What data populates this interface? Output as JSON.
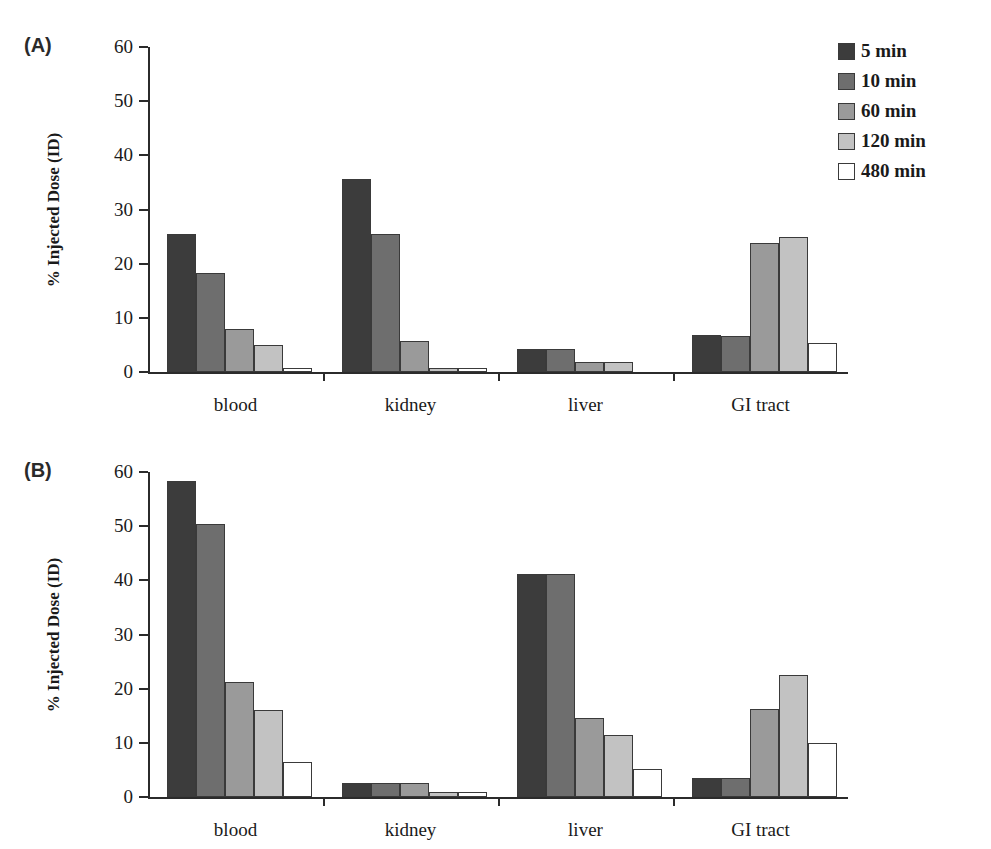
{
  "figure": {
    "panels": [
      {
        "id": "A",
        "label": "(A)"
      },
      {
        "id": "B",
        "label": "(B)"
      }
    ],
    "ylabel": "% Injected Dose (ID)",
    "series_colors": [
      "#3c3c3c",
      "#6e6e6e",
      "#9a9a9a",
      "#c2c2c2",
      "#ffffff"
    ],
    "ytick_labels": [
      "0",
      "10",
      "20",
      "30",
      "40",
      "50",
      "60"
    ]
  },
  "legend": {
    "items": [
      {
        "label": "5 min",
        "color": "#3c3c3c"
      },
      {
        "label": "10 min",
        "color": "#6e6e6e"
      },
      {
        "label": "60 min",
        "color": "#9a9a9a"
      },
      {
        "label": "120 min",
        "color": "#c2c2c2"
      },
      {
        "label": "480 min",
        "color": "#ffffff"
      }
    ]
  },
  "chart_data": [
    {
      "type": "bar",
      "panel": "A",
      "title": "(A)",
      "xlabel": "",
      "ylabel": "% Injected Dose (ID)",
      "ylim": [
        0,
        60
      ],
      "yticks": [
        0,
        10,
        20,
        30,
        40,
        50,
        60
      ],
      "grid": false,
      "legend_position": "top-right",
      "categories": [
        "blood",
        "kidney",
        "liver",
        "GI tract"
      ],
      "series": [
        {
          "name": "5 min",
          "color": "#3c3c3c",
          "values": [
            25.4,
            35.7,
            4.2,
            6.8
          ]
        },
        {
          "name": "10 min",
          "color": "#6e6e6e",
          "values": [
            18.3,
            25.4,
            4.2,
            6.7
          ]
        },
        {
          "name": "60 min",
          "color": "#9a9a9a",
          "values": [
            8.0,
            5.7,
            1.9,
            23.9
          ]
        },
        {
          "name": "120 min",
          "color": "#c2c2c2",
          "values": [
            4.9,
            0.8,
            1.9,
            25.0
          ]
        },
        {
          "name": "480 min",
          "color": "#ffffff",
          "values": [
            0.8,
            0.8,
            0.0,
            5.3
          ]
        }
      ]
    },
    {
      "type": "bar",
      "panel": "B",
      "title": "(B)",
      "xlabel": "",
      "ylabel": "% Injected Dose (ID)",
      "ylim": [
        0,
        60
      ],
      "yticks": [
        0,
        10,
        20,
        30,
        40,
        50,
        60
      ],
      "grid": false,
      "legend_position": "top-right",
      "categories": [
        "blood",
        "kidney",
        "liver",
        "GI tract"
      ],
      "series": [
        {
          "name": "5 min",
          "color": "#3c3c3c",
          "values": [
            58.3,
            2.5,
            41.2,
            3.5
          ]
        },
        {
          "name": "10 min",
          "color": "#6e6e6e",
          "values": [
            50.4,
            2.5,
            41.2,
            3.5
          ]
        },
        {
          "name": "60 min",
          "color": "#9a9a9a",
          "values": [
            21.2,
            2.5,
            14.5,
            16.2
          ]
        },
        {
          "name": "120 min",
          "color": "#c2c2c2",
          "values": [
            16.0,
            1.0,
            11.5,
            22.5
          ]
        },
        {
          "name": "480 min",
          "color": "#ffffff",
          "values": [
            6.5,
            1.0,
            5.2,
            10.0
          ]
        }
      ]
    }
  ]
}
